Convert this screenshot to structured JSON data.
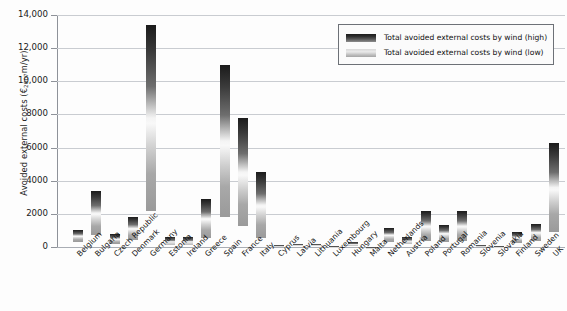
{
  "chart_data": {
    "type": "bar",
    "title": "",
    "subtitle": "",
    "xlabel": "",
    "ylabel": "Avoided external costs (€2007m/yr)",
    "ylabel_prefix": "Avoided external costs (€",
    "ylabel_sub": "2007",
    "ylabel_suffix": "m/yr)",
    "ylim": [
      0,
      14000
    ],
    "grid": true,
    "legend_position": "top-right",
    "yticks": [
      0,
      2000,
      4000,
      6000,
      8000,
      10000,
      12000,
      14000
    ],
    "ytick_labels": [
      "0",
      "2000",
      "4000",
      "6000",
      "8000",
      "10,000",
      "12,000",
      "14,000"
    ],
    "legend": [
      "Total avoided external costs by wind (high)",
      "Total avoided external costs by wind (low)"
    ],
    "categories": [
      "Belgium",
      "Bulgaria",
      "Czech Republic",
      "Denmark",
      "Germany",
      "Estonia",
      "Ireland",
      "Greece",
      "Spain",
      "France",
      "Italy",
      "Cyprus",
      "Latvia",
      "Lithuania",
      "Luxembourg",
      "Hungary",
      "Malta",
      "Netherlands",
      "Austria",
      "Poland",
      "Portugal",
      "Romania",
      "Slovenia",
      "Slovakia",
      "Finland",
      "Sweden",
      "UK"
    ],
    "series": [
      {
        "name": "Total avoided external costs by wind (high)",
        "values": [
          1000,
          3400,
          800,
          1800,
          13400,
          600,
          600,
          2900,
          11000,
          7800,
          4500,
          120,
          180,
          180,
          60,
          330,
          30,
          1150,
          620,
          2150,
          1300,
          2200,
          120,
          90,
          900,
          1400,
          6300
        ]
      },
      {
        "name": "Total avoided external costs by wind (low)",
        "values": [
          300,
          700,
          200,
          400,
          2200,
          150,
          150,
          550,
          1800,
          1250,
          550,
          30,
          40,
          40,
          15,
          80,
          8,
          330,
          180,
          380,
          330,
          380,
          30,
          20,
          230,
          340,
          900
        ]
      }
    ]
  },
  "legend": {
    "high_label": "Total avoided external costs by wind (high)",
    "low_label": "Total avoided external costs by wind (low)",
    "swatch_high_name": "legend-swatch-high",
    "swatch_low_name": "legend-swatch-low"
  },
  "colors": {
    "bar_high": "#1b1b1b",
    "bar_low": "#a8a8a8",
    "grid": "#c9ccd1",
    "axis": "#8e9299",
    "text": "#111111",
    "background": "#fdfdfd",
    "legend_border": "#6d7177"
  }
}
